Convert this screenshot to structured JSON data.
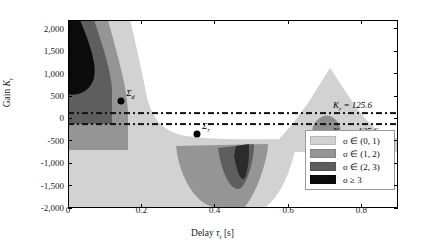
{
  "chart_data": {
    "type": "heatmap",
    "title": "",
    "xlabel": "Delay τr [s]",
    "ylabel": "Gain Kr",
    "xlim": [
      0,
      0.9
    ],
    "ylim": [
      -2000,
      2200
    ],
    "xticks": [
      0,
      0.2,
      0.4,
      0.6,
      0.8
    ],
    "xtick_labels": [
      "0",
      "0.2",
      "0.4",
      "0.6",
      "0.8"
    ],
    "yticks": [
      -2000,
      -1500,
      -1000,
      -500,
      0,
      500,
      1000,
      1500,
      2000
    ],
    "ytick_labels": [
      "-2,000",
      "-1,500",
      "-1,000",
      "-500",
      "0",
      "500",
      "1,000",
      "1,500",
      "2,000"
    ],
    "grid": false,
    "legend_position": "lower right",
    "colorbar_levels": [
      {
        "label": "σ ∈ (0, 1)",
        "color": "#d2d2d2"
      },
      {
        "label": "σ ∈ (1, 2)",
        "color": "#959595"
      },
      {
        "label": "σ ∈ (2, 3)",
        "color": "#5e5e5e"
      },
      {
        "label": "σ ≥ 3",
        "color": "#0b0b0b"
      }
    ],
    "reference_lines": [
      {
        "label": "Kr = 125.6",
        "value": 125.6,
        "style": "dash-dot"
      },
      {
        "label": "Kr = -125.6",
        "value": -125.6,
        "style": "dash-dot"
      }
    ],
    "markers": [
      {
        "label": "Σ",
        "x": 0.145,
        "y": 400
      },
      {
        "label": "Σ",
        "x": 0.352,
        "y": -350
      }
    ]
  },
  "axes": {
    "ylabel_prefix": "Gain ",
    "ylabel_sym": "K",
    "ylabel_sub": "r",
    "xlabel_prefix": "Delay ",
    "xlabel_sym": "τ",
    "xlabel_sub": "r",
    "xlabel_suffix": " [s]"
  },
  "reflabels": {
    "upper_sym": "K",
    "upper_sub": "r",
    "upper_eq": " = 125.6",
    "lower_sym": "K",
    "lower_sub": "r",
    "lower_eq": " = −125.6"
  },
  "legend": {
    "rows": [
      {
        "label": "σ ∈ (0, 1)"
      },
      {
        "label": "σ ∈ (1, 2)"
      },
      {
        "label": "σ ∈ (2, 3)"
      },
      {
        "label": "σ ≥ 3"
      }
    ]
  },
  "markers": {
    "sigma1": "Σ",
    "sigma2": "Σ",
    "sub1": "d",
    "sub2": "r"
  }
}
